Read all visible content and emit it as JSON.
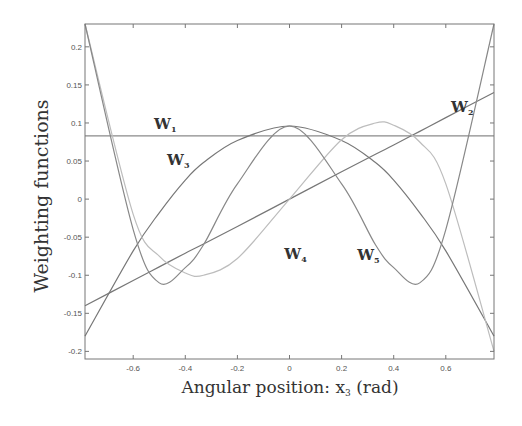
{
  "chart_data": {
    "type": "line",
    "title": "",
    "xlabel": "Angular position: x₃ (rad)",
    "ylabel": "Weighting functions",
    "xlim": [
      -0.785,
      0.785
    ],
    "ylim": [
      -0.21,
      0.23
    ],
    "x_ticks": [
      -0.6,
      -0.4,
      -0.2,
      0,
      0.2,
      0.4,
      0.6
    ],
    "x_tick_labels": [
      "-0.6",
      "-0.4",
      "-0.2",
      "0",
      "0.2",
      "0.4",
      "0.6"
    ],
    "y_ticks": [
      -0.2,
      -0.15,
      -0.1,
      -0.05,
      0,
      0.05,
      0.1,
      0.15,
      0.2
    ],
    "y_tick_labels": [
      "-0.2",
      "-0.15",
      "-0.1",
      "-0.05",
      "0",
      "0.05",
      "0.1",
      "0.15",
      "0.2"
    ],
    "grid": false,
    "legend": "inline labels",
    "x": [
      -0.785,
      -0.6,
      -0.5,
      -0.4,
      -0.33,
      -0.2,
      0,
      0.2,
      0.33,
      0.4,
      0.5,
      0.6,
      0.785
    ],
    "series": [
      {
        "name": "W1",
        "label_main": "W",
        "label_sub": "1",
        "values": [
          0.083,
          0.083,
          0.083,
          0.083,
          0.083,
          0.083,
          0.083,
          0.083,
          0.083,
          0.083,
          0.083,
          0.083,
          0.083
        ]
      },
      {
        "name": "W2",
        "label_main": "W",
        "label_sub": "2",
        "values": [
          -0.14,
          -0.107,
          -0.089,
          -0.071,
          -0.059,
          -0.036,
          0.0,
          0.036,
          0.059,
          0.071,
          0.089,
          0.107,
          0.14
        ]
      },
      {
        "name": "W3",
        "label_main": "W",
        "label_sub": "3",
        "values": [
          -0.18,
          -0.068,
          -0.018,
          0.025,
          0.048,
          0.077,
          0.096,
          0.077,
          0.048,
          0.025,
          -0.018,
          -0.068,
          -0.18
        ]
      },
      {
        "name": "W4",
        "label_main": "W",
        "label_sub": "4",
        "values": [
          0.23,
          -0.02,
          -0.075,
          -0.097,
          -0.1,
          -0.078,
          0.0,
          0.078,
          0.1,
          0.097,
          0.075,
          0.02,
          -0.2
        ]
      },
      {
        "name": "W5",
        "label_main": "W",
        "label_sub": "5",
        "values": [
          0.23,
          -0.04,
          -0.11,
          -0.09,
          -0.06,
          0.02,
          0.096,
          0.02,
          -0.06,
          -0.09,
          -0.11,
          -0.04,
          0.23
        ]
      }
    ],
    "annotations": [
      {
        "text": "W1",
        "x": -0.52,
        "y": 0.092
      },
      {
        "text": "W2",
        "x": 0.62,
        "y": 0.115
      },
      {
        "text": "W3",
        "x": -0.47,
        "y": 0.045
      },
      {
        "text": "W4",
        "x": -0.02,
        "y": -0.078
      },
      {
        "text": "W5",
        "x": 0.26,
        "y": -0.08
      }
    ]
  },
  "axes": {
    "xlabel_main": "Angular position: x",
    "xlabel_sub": "3",
    "xlabel_tail": " (rad)",
    "ylabel": "Weighting functions"
  }
}
